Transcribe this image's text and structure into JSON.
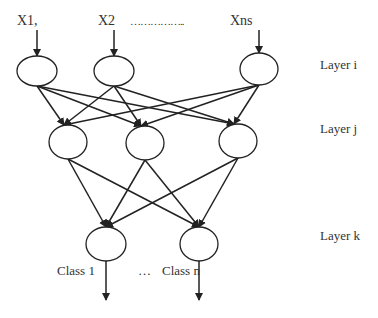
{
  "inputs": [
    {
      "label": "X1,",
      "x": 17,
      "y": 14
    },
    {
      "label": "X2",
      "x": 98,
      "y": 14
    },
    {
      "label": "……………..",
      "x": 130,
      "y": 14
    },
    {
      "label": "Xns",
      "x": 230,
      "y": 14
    }
  ],
  "layers": [
    {
      "label": "Layer i",
      "x": 320,
      "y": 58
    },
    {
      "label": "Layer j",
      "x": 320,
      "y": 122
    },
    {
      "label": "Layer k",
      "x": 320,
      "y": 229
    }
  ],
  "outputs": [
    {
      "label": "Class 1",
      "x": 57,
      "y": 263
    },
    {
      "label": "…",
      "x": 138,
      "y": 263
    },
    {
      "label": "Class n",
      "x": 162,
      "y": 263
    }
  ],
  "nodes": {
    "layer_i": [
      {
        "cx": 37,
        "cy": 71,
        "rx": 20,
        "ry": 15
      },
      {
        "cx": 114,
        "cy": 71,
        "rx": 20,
        "ry": 15
      },
      {
        "cx": 259,
        "cy": 69,
        "rx": 19,
        "ry": 16
      }
    ],
    "layer_j": [
      {
        "cx": 68,
        "cy": 142,
        "rx": 19,
        "ry": 17
      },
      {
        "cx": 145,
        "cy": 143,
        "rx": 19,
        "ry": 17
      },
      {
        "cx": 238,
        "cy": 141,
        "rx": 19,
        "ry": 17
      }
    ],
    "layer_k": [
      {
        "cx": 106,
        "cy": 244,
        "rx": 20,
        "ry": 17
      },
      {
        "cx": 199,
        "cy": 244,
        "rx": 19,
        "ry": 17
      }
    ]
  },
  "colors": {
    "stroke": "#222222",
    "background": "#ffffff"
  }
}
